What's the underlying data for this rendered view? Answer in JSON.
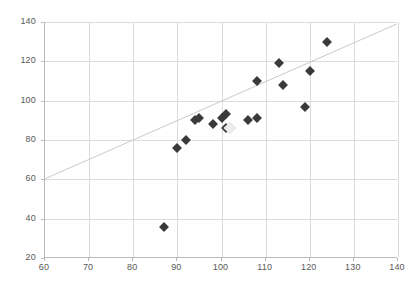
{
  "chart_data": {
    "type": "scatter",
    "title": "",
    "subtitle": "",
    "xlabel": "",
    "ylabel": "",
    "xlim": [
      60,
      140
    ],
    "ylim": [
      20,
      140
    ],
    "xticks": [
      60,
      70,
      80,
      90,
      100,
      110,
      120,
      130,
      140
    ],
    "yticks": [
      20,
      40,
      60,
      80,
      100,
      120,
      140
    ],
    "grid": true,
    "legend": "none",
    "marker_shape": "diamond",
    "marker_color": "#3a3a3a",
    "highlight_marker_color": "#ededed",
    "gridline_color": "#dcdcdc",
    "axis_color": "#b9b9b9",
    "trendline_color": "#c9c9c9",
    "series": [
      {
        "name": "observations",
        "points": [
          {
            "x": 87,
            "y": 36,
            "highlight": false
          },
          {
            "x": 90,
            "y": 76,
            "highlight": false
          },
          {
            "x": 92,
            "y": 80,
            "highlight": false
          },
          {
            "x": 94,
            "y": 90,
            "highlight": false
          },
          {
            "x": 95,
            "y": 91,
            "highlight": false
          },
          {
            "x": 98,
            "y": 88,
            "highlight": false
          },
          {
            "x": 100,
            "y": 91,
            "highlight": false
          },
          {
            "x": 101,
            "y": 93,
            "highlight": false
          },
          {
            "x": 101,
            "y": 86,
            "highlight": false
          },
          {
            "x": 102,
            "y": 86,
            "highlight": true
          },
          {
            "x": 106,
            "y": 90,
            "highlight": false
          },
          {
            "x": 108,
            "y": 91,
            "highlight": false
          },
          {
            "x": 108,
            "y": 110,
            "highlight": false
          },
          {
            "x": 113,
            "y": 119,
            "highlight": false
          },
          {
            "x": 114,
            "y": 108,
            "highlight": false
          },
          {
            "x": 119,
            "y": 97,
            "highlight": false
          },
          {
            "x": 120,
            "y": 115,
            "highlight": false
          },
          {
            "x": 124,
            "y": 130,
            "highlight": false
          }
        ]
      }
    ],
    "trendline": {
      "type": "linear",
      "x_start": 60,
      "y_start": 60,
      "x_end": 140,
      "y_end": 139
    }
  },
  "axes": {
    "x_tick_labels": [
      "60",
      "70",
      "80",
      "90",
      "100",
      "110",
      "120",
      "130",
      "140"
    ],
    "y_tick_labels": [
      "20",
      "40",
      "60",
      "80",
      "100",
      "120",
      "140"
    ]
  }
}
